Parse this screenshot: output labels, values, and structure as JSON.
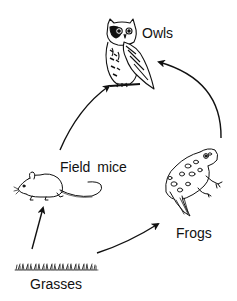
{
  "diagram": {
    "type": "food-chain",
    "nodes": [
      {
        "id": "owls",
        "label": "Owls",
        "icon": "owl-icon"
      },
      {
        "id": "field_mice",
        "label": "Field  mice",
        "icon": "mouse-icon"
      },
      {
        "id": "frogs",
        "label": "Frogs",
        "icon": "frog-icon"
      },
      {
        "id": "grasses",
        "label": "Grasses",
        "icon": "grass-icon"
      }
    ],
    "edges": [
      {
        "from": "grasses",
        "to": "field_mice"
      },
      {
        "from": "grasses",
        "to": "frogs"
      },
      {
        "from": "field_mice",
        "to": "owls"
      },
      {
        "from": "frogs",
        "to": "owls"
      }
    ],
    "colors": {
      "ink": "#111111",
      "background": "#ffffff"
    }
  }
}
